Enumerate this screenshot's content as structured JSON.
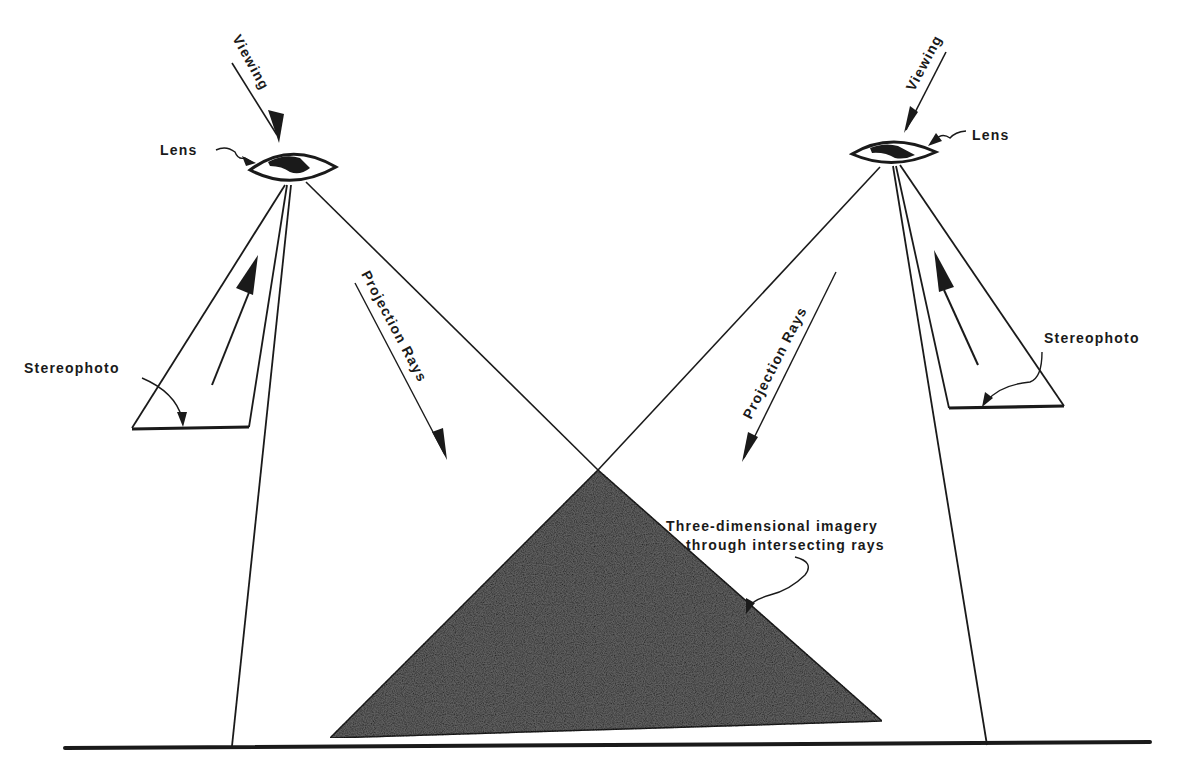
{
  "diagram": {
    "labels": {
      "viewing_left": "Viewing",
      "viewing_right": "Viewing",
      "lens_left": "Lens",
      "lens_right": "Lens",
      "stereophoto_left": "Stereophoto",
      "stereophoto_right": "Stereophoto",
      "projection_rays_left": "Projection Rays",
      "projection_rays_right": "Projection Rays",
      "imagery_line1": "Three-dimensional imagery",
      "imagery_line2": "through intersecting rays"
    },
    "colors": {
      "ink": "#1a1a1a",
      "imagery_fill": "#5a5a5a",
      "background": "#ffffff"
    }
  }
}
